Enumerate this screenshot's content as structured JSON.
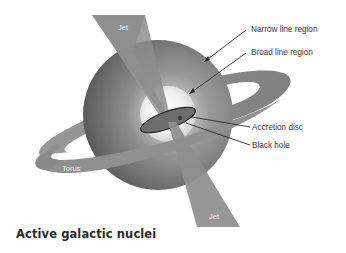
{
  "title": "Active galactic nuclei",
  "labels": {
    "jet_top": "Jet",
    "jet_bottom": "Jet",
    "torus": "Torus",
    "narrow_line_region": "Narrow line region",
    "broad_line_region": "Broad line region",
    "accretion_disc": "Accretion disc",
    "black_hole": "Black hole"
  },
  "colors": {
    "outer_sphere_light": "#9a9a9a",
    "outer_sphere_dark": "#5c5c5c",
    "inner_sphere": "#f4f4f4",
    "jet": "#8a8a8a",
    "torus": "#8e8e8e",
    "disc_fill": "#6e6e6e",
    "outline": "#222222",
    "label_text": "#3a3a3a"
  }
}
